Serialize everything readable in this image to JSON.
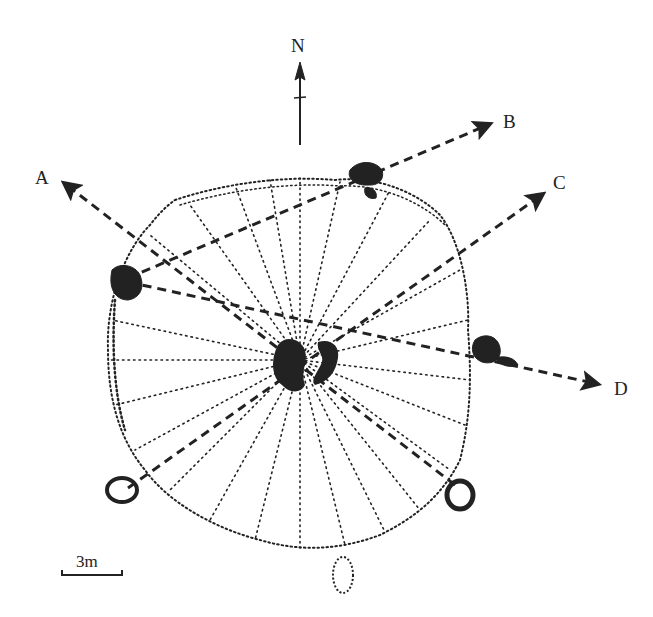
{
  "figure": {
    "type": "site plan"
  },
  "north_arrow": {
    "label": "N"
  },
  "transects": [
    {
      "id": "A",
      "label": "A"
    },
    {
      "id": "B",
      "label": "B"
    },
    {
      "id": "C",
      "label": "C"
    },
    {
      "id": "D",
      "label": "D"
    }
  ],
  "scale_bar": {
    "label": "3m"
  },
  "colors": {
    "ink": "#222222",
    "background": "#ffffff"
  }
}
